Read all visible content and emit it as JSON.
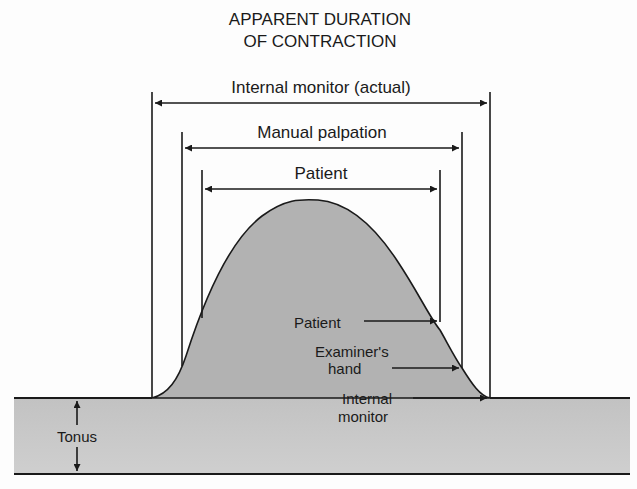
{
  "title": {
    "line1": "APPARENT DURATION",
    "line2": "OF CONTRACTION"
  },
  "spans": [
    {
      "label": "Internal monitor (actual)",
      "x1": 152,
      "x2": 490,
      "y": 103,
      "line_top": 92
    },
    {
      "label": "Manual palpation",
      "x1": 182,
      "x2": 462,
      "y": 148,
      "line_top": 132
    },
    {
      "label": "Patient",
      "x1": 202,
      "x2": 440,
      "y": 189,
      "line_top": 170
    }
  ],
  "annotations": {
    "patient": "Patient",
    "examiner_line1": "Examiner's",
    "examiner_line2": "hand",
    "internal_line1": "Internal",
    "internal_line2": "monitor"
  },
  "tonus_label": "Tonus",
  "colors": {
    "fill": "#b4b4b4",
    "band": "#c9c9c9",
    "line": "#1a1a1a"
  }
}
